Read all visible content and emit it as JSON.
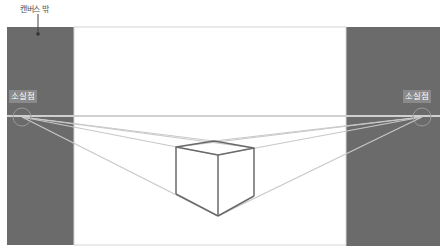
{
  "callout": {
    "label": "캔버스 밖"
  },
  "vanishing_points": {
    "left": {
      "label": "소실점",
      "x": 22,
      "y": 117
    },
    "right": {
      "label": "소실점",
      "x": 422,
      "y": 117
    }
  },
  "colors": {
    "outside_canvas": "#6b6b6b",
    "canvas": "#ffffff",
    "guide_lines": "#c8c8c8",
    "cube_lines": "#6a6a6a",
    "vp_circle": "#9a9a9a"
  },
  "cube": {
    "top_left": [
      176,
      147
    ],
    "top_back": [
      214,
      141
    ],
    "top_right": [
      254,
      148
    ],
    "top_front": [
      218,
      155
    ],
    "bottom_left": [
      176,
      194
    ],
    "bottom_front": [
      218,
      216
    ],
    "bottom_right": [
      254,
      196
    ]
  }
}
